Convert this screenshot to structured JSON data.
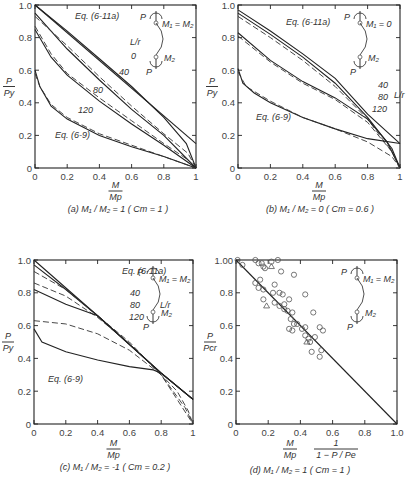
{
  "chart_data": [
    {
      "id": "a",
      "type": "line",
      "caption": "(a)  M₁ / M₂ = 1 ( Cm = 1 )",
      "xlabel_num": "M",
      "xlabel_den": "Mp",
      "ylabel_num": "P",
      "ylabel_den": "Py",
      "xticks": [
        "0",
        "0.2",
        "0.4",
        "0.6",
        "0.8",
        "1"
      ],
      "yticks": [
        "0",
        "0.2",
        "0.4",
        "0.6",
        "0.8",
        "1.0"
      ],
      "xlim": [
        0,
        1
      ],
      "ylim": [
        0,
        1
      ],
      "annotations": [
        "Eq. (6-11a)",
        "Eq. (6-9)",
        "L/r",
        "0",
        "40",
        "80",
        "120"
      ],
      "inset": {
        "top": "P",
        "m1": "M₁ = M₂",
        "m2": "M₂",
        "bottom": "P"
      },
      "series": [
        {
          "name": "L/r=0 Eq.(6-9)",
          "style": "solid",
          "points": [
            [
              0,
              1.0
            ],
            [
              0.2,
              0.84
            ],
            [
              0.4,
              0.67
            ],
            [
              0.6,
              0.5
            ],
            [
              0.8,
              0.31
            ],
            [
              0.94,
              0.15
            ],
            [
              1,
              0
            ]
          ]
        },
        {
          "name": "L/r=0 Eq.(6-11a)",
          "style": "solid",
          "points": [
            [
              0,
              1.0
            ],
            [
              1,
              0.15
            ]
          ]
        },
        {
          "name": "L/r=40 Eq.(6-9)",
          "style": "solid",
          "points": [
            [
              0,
              0.95
            ],
            [
              0.2,
              0.73
            ],
            [
              0.4,
              0.54
            ],
            [
              0.6,
              0.36
            ],
            [
              0.8,
              0.2
            ],
            [
              1,
              0
            ]
          ]
        },
        {
          "name": "L/r=40 Eq.(6-11a)",
          "style": "dash",
          "points": [
            [
              0,
              0.93
            ],
            [
              0.2,
              0.75
            ],
            [
              0.4,
              0.56
            ],
            [
              0.6,
              0.38
            ],
            [
              0.8,
              0.21
            ],
            [
              0.95,
              0.09
            ],
            [
              1,
              0
            ]
          ]
        },
        {
          "name": "L/r=80 Eq.(6-9)",
          "style": "solid",
          "points": [
            [
              0,
              0.85
            ],
            [
              0.1,
              0.68
            ],
            [
              0.2,
              0.57
            ],
            [
              0.4,
              0.41
            ],
            [
              0.6,
              0.27
            ],
            [
              0.8,
              0.14
            ],
            [
              1,
              0
            ]
          ]
        },
        {
          "name": "L/r=80 Eq.(6-11a)",
          "style": "dash",
          "points": [
            [
              0,
              0.87
            ],
            [
              0.1,
              0.7
            ],
            [
              0.2,
              0.58
            ],
            [
              0.4,
              0.43
            ],
            [
              0.6,
              0.29
            ],
            [
              0.8,
              0.15
            ],
            [
              0.95,
              0.05
            ],
            [
              1,
              0
            ]
          ]
        },
        {
          "name": "L/r=120 Eq.(6-9)",
          "style": "solid",
          "points": [
            [
              0,
              0.6
            ],
            [
              0.03,
              0.5
            ],
            [
              0.1,
              0.38
            ],
            [
              0.2,
              0.3
            ],
            [
              0.4,
              0.2
            ],
            [
              0.6,
              0.13
            ],
            [
              0.8,
              0.07
            ],
            [
              1,
              0
            ]
          ]
        },
        {
          "name": "L/r=120 Eq.(6-11a)",
          "style": "dash",
          "points": [
            [
              0,
              0.58
            ],
            [
              0.03,
              0.5
            ],
            [
              0.1,
              0.39
            ],
            [
              0.2,
              0.31
            ],
            [
              0.4,
              0.21
            ],
            [
              0.6,
              0.14
            ],
            [
              0.8,
              0.07
            ],
            [
              1,
              0
            ]
          ]
        }
      ]
    },
    {
      "id": "b",
      "type": "line",
      "caption": "(b)  M₁ / M₂ = 0 ( Cm = 0.6 )",
      "xlabel_num": "M",
      "xlabel_den": "Mp",
      "ylabel_num": "P",
      "ylabel_den": "Py",
      "xticks": [
        "0",
        "0.2",
        "0.4",
        "0.6",
        "0.8",
        "1"
      ],
      "yticks": [
        "0",
        "0.2",
        "0.4",
        "0.6",
        "0.8",
        "1.0"
      ],
      "xlim": [
        0,
        1
      ],
      "ylim": [
        0,
        1
      ],
      "annotations": [
        "Eq. (6-11a)",
        "Eq. (6-9)",
        "40",
        "80",
        "120",
        "L/r"
      ],
      "inset": {
        "top": "P",
        "m1": "M₁ = 0",
        "m2": "M₂",
        "bottom": "P"
      },
      "series": [
        {
          "name": "L/r=40 Eq.(6-11a)",
          "style": "solid",
          "points": [
            [
              0,
              0.97
            ],
            [
              0.2,
              0.84
            ],
            [
              0.4,
              0.7
            ],
            [
              0.6,
              0.55
            ],
            [
              0.8,
              0.33
            ],
            [
              1,
              0.15
            ]
          ]
        },
        {
          "name": "L/r=40 Eq.(6-9)",
          "style": "solid",
          "points": [
            [
              0,
              0.95
            ],
            [
              0.2,
              0.82
            ],
            [
              0.4,
              0.68
            ],
            [
              0.6,
              0.52
            ],
            [
              0.8,
              0.31
            ],
            [
              0.95,
              0.12
            ],
            [
              1,
              0
            ]
          ]
        },
        {
          "name": "L/r=40 dashed",
          "style": "dash",
          "points": [
            [
              0,
              0.93
            ],
            [
              0.2,
              0.8
            ],
            [
              0.4,
              0.66
            ],
            [
              0.6,
              0.5
            ],
            [
              0.8,
              0.3
            ],
            [
              0.95,
              0.1
            ],
            [
              1,
              0
            ]
          ]
        },
        {
          "name": "L/r=80 Eq.(6-9)",
          "style": "solid",
          "points": [
            [
              0,
              0.83
            ],
            [
              0.2,
              0.66
            ],
            [
              0.4,
              0.53
            ],
            [
              0.6,
              0.43
            ],
            [
              0.8,
              0.3
            ],
            [
              0.92,
              0.16
            ],
            [
              1,
              0
            ]
          ]
        },
        {
          "name": "L/r=80 dashed",
          "style": "dash",
          "points": [
            [
              0,
              0.81
            ],
            [
              0.2,
              0.65
            ],
            [
              0.4,
              0.52
            ],
            [
              0.6,
              0.42
            ],
            [
              0.8,
              0.28
            ],
            [
              0.95,
              0.1
            ],
            [
              1,
              0
            ]
          ]
        },
        {
          "name": "L/r=120 Eq.(6-9)",
          "style": "solid",
          "points": [
            [
              0,
              0.61
            ],
            [
              0.03,
              0.52
            ],
            [
              0.1,
              0.46
            ],
            [
              0.2,
              0.4
            ],
            [
              0.4,
              0.31
            ],
            [
              0.6,
              0.24
            ],
            [
              0.8,
              0.18
            ],
            [
              1,
              0.15
            ]
          ]
        },
        {
          "name": "L/r=120 dashed",
          "style": "dash",
          "points": [
            [
              0,
              0.59
            ],
            [
              0.05,
              0.5
            ],
            [
              0.2,
              0.41
            ],
            [
              0.4,
              0.31
            ],
            [
              0.6,
              0.24
            ],
            [
              0.8,
              0.16
            ],
            [
              0.95,
              0.07
            ],
            [
              1,
              0
            ]
          ]
        }
      ]
    },
    {
      "id": "c",
      "type": "line",
      "caption": "(c)  M₁ / M₂ = -1 ( Cm = 0.2 )",
      "xlabel_num": "M",
      "xlabel_den": "Mp",
      "ylabel_num": "P",
      "ylabel_den": "Py",
      "xticks": [
        "0",
        "0.2",
        "0.4",
        "0.6",
        "0.8",
        "1"
      ],
      "yticks": [
        "0",
        "0.2",
        "0.4",
        "0.6",
        "0.8",
        "1.0"
      ],
      "xlim": [
        0,
        1
      ],
      "ylim": [
        0,
        1
      ],
      "annotations": [
        "Eq. (6-11a)",
        "Eq. (6-9)",
        "40",
        "80",
        "120",
        "L/r"
      ],
      "inset": {
        "top": "P",
        "m1": "M₁ = M₂",
        "m2": "M₂",
        "bottom": "P"
      },
      "series": [
        {
          "name": "L/r=0 envelope",
          "style": "solid",
          "points": [
            [
              0,
              1.0
            ],
            [
              0.4,
              0.66
            ],
            [
              0.8,
              0.31
            ],
            [
              1,
              0.15
            ]
          ]
        },
        {
          "name": "L/r=40 Eq.(6-9)",
          "style": "solid",
          "points": [
            [
              0,
              0.97
            ],
            [
              0.2,
              0.82
            ],
            [
              0.4,
              0.66
            ],
            [
              0.8,
              0.31
            ],
            [
              1,
              0.15
            ]
          ]
        },
        {
          "name": "L/r=40 dashed",
          "style": "dash",
          "points": [
            [
              0,
              0.93
            ],
            [
              0.2,
              0.82
            ],
            [
              0.4,
              0.66
            ],
            [
              0.6,
              0.5
            ],
            [
              0.8,
              0.3
            ],
            [
              0.9,
              0.2
            ],
            [
              0.97,
              0.08
            ],
            [
              1,
              0
            ]
          ]
        },
        {
          "name": "L/r=80 dashed",
          "style": "dash",
          "points": [
            [
              0,
              0.86
            ],
            [
              0.2,
              0.78
            ],
            [
              0.4,
              0.65
            ],
            [
              0.6,
              0.49
            ],
            [
              0.8,
              0.3
            ],
            [
              1,
              0
            ]
          ]
        },
        {
          "name": "L/r=80 Eq.(6-9)",
          "style": "solid",
          "points": [
            [
              0,
              0.82
            ],
            [
              0.2,
              0.73
            ],
            [
              0.4,
              0.66
            ],
            [
              0.8,
              0.31
            ],
            [
              1,
              0.15
            ]
          ]
        },
        {
          "name": "L/r=120 dashed",
          "style": "dash",
          "points": [
            [
              0,
              0.63
            ],
            [
              0.2,
              0.61
            ],
            [
              0.4,
              0.55
            ],
            [
              0.6,
              0.45
            ],
            [
              0.8,
              0.3
            ],
            [
              0.95,
              0.1
            ],
            [
              1,
              0
            ]
          ]
        },
        {
          "name": "L/r=120 Eq.(6-9)",
          "style": "solid",
          "points": [
            [
              0,
              0.58
            ],
            [
              0.05,
              0.5
            ],
            [
              0.2,
              0.44
            ],
            [
              0.4,
              0.39
            ],
            [
              0.6,
              0.35
            ],
            [
              0.75,
              0.33
            ],
            [
              0.8,
              0.31
            ],
            [
              1,
              0.15
            ]
          ]
        }
      ]
    },
    {
      "id": "d",
      "type": "scatter",
      "caption": "(d)  M₁ / M₂ = 1 ( Cm = 1 )",
      "xlabel_num": "M",
      "xlabel_den": "Mp",
      "xlabel_extra_num": "1",
      "xlabel_extra_den": "1 − P / Pe",
      "ylabel_num": "P",
      "ylabel_den": "Pcr",
      "xticks": [
        "0",
        "0.2",
        "0.4",
        "0.6",
        "0.8",
        "1.0"
      ],
      "yticks": [
        "0",
        "0.2",
        "0.4",
        "0.6",
        "0.8",
        "1.00"
      ],
      "xlim": [
        0,
        1
      ],
      "ylim": [
        0,
        1
      ],
      "inset": {
        "top": "P",
        "m1": "M₁ = M₂",
        "m2": "M₂",
        "bottom": "P"
      },
      "line": [
        [
          0,
          1
        ],
        [
          1,
          0
        ]
      ],
      "circles": [
        [
          0.01,
          1.0
        ],
        [
          0.04,
          0.97
        ],
        [
          0.12,
          1.0
        ],
        [
          0.14,
          0.98
        ],
        [
          0.16,
          0.98
        ],
        [
          0.17,
          0.96
        ],
        [
          0.22,
          0.99
        ],
        [
          0.26,
          1.0
        ],
        [
          0.18,
          0.95
        ],
        [
          0.28,
          0.93
        ],
        [
          0.36,
          0.91
        ],
        [
          0.12,
          0.86
        ],
        [
          0.15,
          0.88
        ],
        [
          0.14,
          0.83
        ],
        [
          0.17,
          0.82
        ],
        [
          0.24,
          0.85
        ],
        [
          0.23,
          0.8
        ],
        [
          0.27,
          0.8
        ],
        [
          0.29,
          0.79
        ],
        [
          0.43,
          0.79
        ],
        [
          0.17,
          0.76
        ],
        [
          0.24,
          0.74
        ],
        [
          0.27,
          0.72
        ],
        [
          0.3,
          0.73
        ],
        [
          0.3,
          0.7
        ],
        [
          0.32,
          0.69
        ],
        [
          0.33,
          0.76
        ],
        [
          0.35,
          0.68
        ],
        [
          0.48,
          0.68
        ],
        [
          0.34,
          0.64
        ],
        [
          0.36,
          0.61
        ],
        [
          0.38,
          0.61
        ],
        [
          0.33,
          0.58
        ],
        [
          0.35,
          0.57
        ],
        [
          0.41,
          0.58
        ],
        [
          0.43,
          0.59
        ],
        [
          0.43,
          0.54
        ],
        [
          0.45,
          0.52
        ],
        [
          0.46,
          0.5
        ],
        [
          0.49,
          0.53
        ],
        [
          0.52,
          0.59
        ],
        [
          0.54,
          0.57
        ],
        [
          0.47,
          0.44
        ],
        [
          0.53,
          0.45
        ],
        [
          0.52,
          0.41
        ]
      ],
      "triangles": [
        [
          0.22,
          0.96
        ],
        [
          0.19,
          0.72
        ],
        [
          0.44,
          0.5
        ]
      ]
    }
  ]
}
